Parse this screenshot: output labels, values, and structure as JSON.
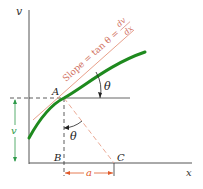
{
  "diagram": {
    "axes": {
      "y_label": "v",
      "x_label": "x"
    },
    "points": {
      "A": "A",
      "B": "B",
      "C": "C"
    },
    "angle_label": "θ",
    "slope_label": "Slope = tan θ = dv/dx",
    "slope_text": "Slope = tan θ =",
    "slope_num": "dv",
    "slope_den": "dx",
    "height_label": "v",
    "width_label": "a",
    "colors": {
      "curve": "#1e8a1e",
      "tangent": "#e8a08a",
      "dim": "#e05a2a",
      "height_dim": "#2e9a4a",
      "axis": "#555555",
      "dash": "#333333",
      "text_red": "#d07060"
    }
  }
}
